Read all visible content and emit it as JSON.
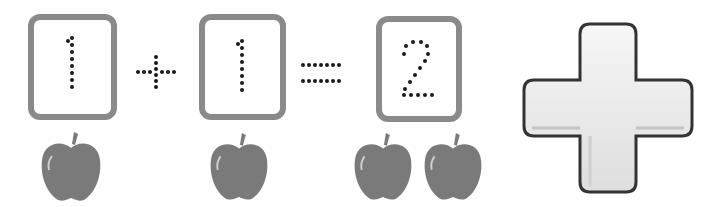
{
  "equation": {
    "addend1": {
      "value": "1",
      "apples": 1
    },
    "operator": "+",
    "addend2": {
      "value": "1",
      "apples": 1
    },
    "equals": "=",
    "sum": {
      "value": "2",
      "apples": 2
    }
  },
  "big_symbol": {
    "name": "plus",
    "glyph": "+"
  },
  "colors": {
    "card_border": "#8a8a8a",
    "apple": "#7a7a7a",
    "dots": "#1a1a1a",
    "cross_fill": "#ececec",
    "cross_outline": "#333333"
  }
}
